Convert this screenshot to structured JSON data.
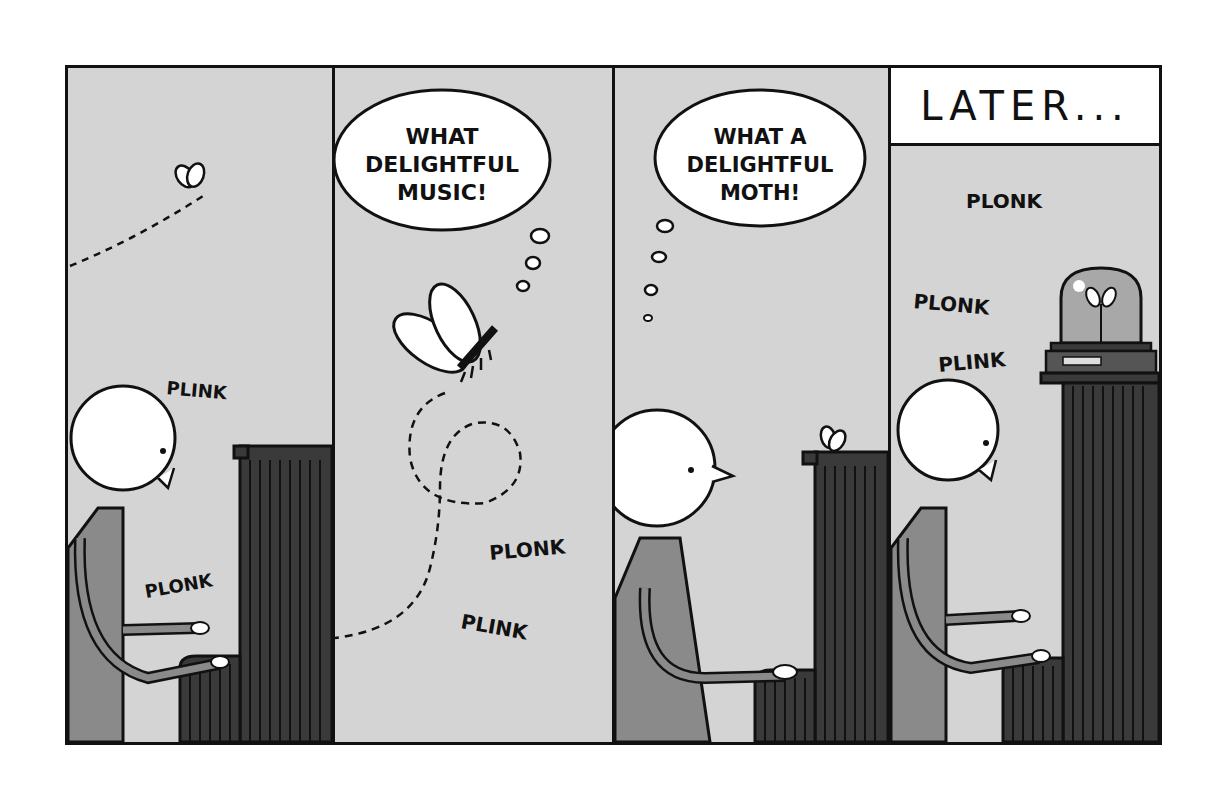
{
  "comic": {
    "panel_count": 4,
    "colors": {
      "background": "#d4d4d4",
      "ink": "#111111",
      "sweater": "#8a8a8a",
      "piano": "#3a3a3a",
      "white": "#ffffff"
    },
    "panels": [
      {
        "id": 1,
        "sound_effects": [
          "PLINK",
          "PLONK"
        ],
        "description": "Person playing piano; moth flies in along dashed path"
      },
      {
        "id": 2,
        "thought_bubble": {
          "lines": [
            "WHAT",
            "DELIGHTFUL",
            "MUSIC!"
          ],
          "speaker": "moth"
        },
        "sound_effects": [
          "PLONK",
          "PLINK"
        ],
        "description": "Moth loops around listening to the music"
      },
      {
        "id": 3,
        "thought_bubble": {
          "lines": [
            "WHAT A",
            "DELIGHTFUL",
            "MOTH!"
          ],
          "speaker": "pianist"
        },
        "description": "Pianist notices the moth resting on the piano"
      },
      {
        "id": 4,
        "caption": "LATER...",
        "sound_effects": [
          "PLONK",
          "PLONK",
          "PLINK"
        ],
        "description": "Moth pinned under a bell jar on top of the piano while pianist plays"
      }
    ]
  }
}
